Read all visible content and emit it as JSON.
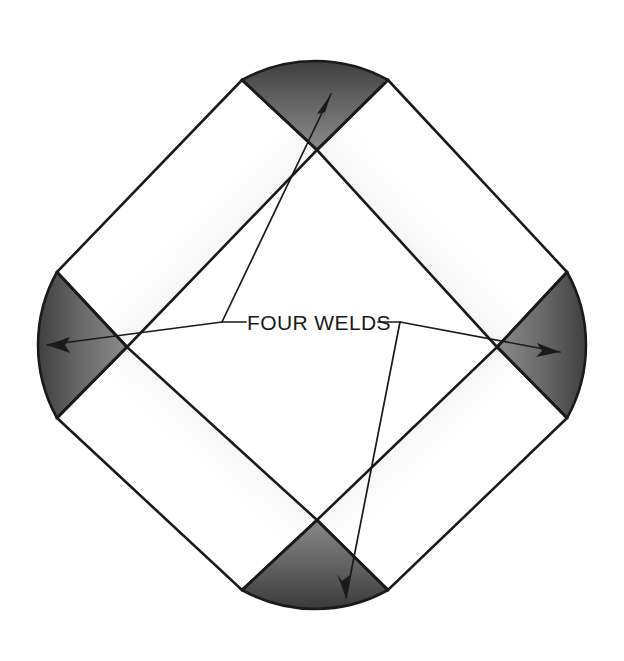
{
  "diagram": {
    "annotation": {
      "label": "FOUR WELDS",
      "label_x": 247,
      "label_y": 330,
      "leader_left_junction": [
        222,
        322
      ],
      "leader_right_junction": [
        400,
        322
      ],
      "callouts": [
        {
          "name": "top-weld",
          "arrow_tip": [
            331,
            94
          ],
          "arrow_from": [
            222,
            322
          ]
        },
        {
          "name": "left-weld",
          "arrow_tip": [
            47,
            345
          ],
          "arrow_from": [
            222,
            322
          ]
        },
        {
          "name": "right-weld",
          "arrow_tip": [
            560,
            352
          ],
          "arrow_from": [
            400,
            322
          ]
        },
        {
          "name": "bottom-weld",
          "arrow_tip": [
            346,
            598
          ],
          "arrow_from": [
            400,
            322
          ]
        }
      ]
    },
    "frame": {
      "center": [
        312,
        335
      ],
      "outer_left": [
        10,
        345
      ],
      "outer_top": [
        315,
        33
      ],
      "outer_right": [
        614,
        345
      ],
      "outer_bottom": [
        315,
        637
      ],
      "tube_thickness": 117,
      "corner_count": 4,
      "weld_names": [
        "top-weld",
        "right-weld",
        "bottom-weld",
        "left-weld"
      ]
    },
    "colors": {
      "background": "#ffffff",
      "outline": "#1a1a1a",
      "weld_dark": "#4a4a4a",
      "weld_mid": "#6e6e6e",
      "weld_light": "#838383",
      "tube_highlight": "#ffffff",
      "tube_shade": "#d8d8d8",
      "tube_edge_shade": "#c2c2c2",
      "label_color": "#1a1a1a"
    }
  }
}
